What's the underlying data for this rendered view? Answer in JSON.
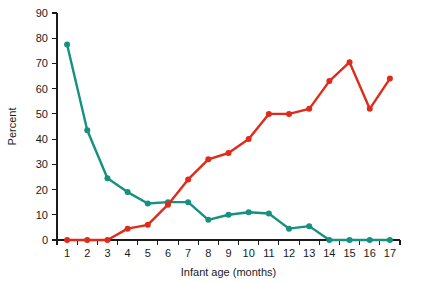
{
  "chart_data": {
    "type": "line",
    "title": "",
    "xlabel": "Infant age (months)",
    "ylabel": "Percent",
    "x": [
      1,
      2,
      3,
      4,
      5,
      6,
      7,
      8,
      9,
      10,
      11,
      12,
      13,
      14,
      15,
      16,
      17
    ],
    "xtick_labels": [
      "1",
      "2",
      "3",
      "4",
      "5",
      "6",
      "7",
      "8",
      "9",
      "10",
      "11",
      "12",
      "13",
      "14",
      "15",
      "16",
      "17"
    ],
    "ytick_labels": [
      "0",
      "10",
      "20",
      "30",
      "40",
      "50",
      "60",
      "70",
      "80",
      "90"
    ],
    "yticks": [
      0,
      10,
      20,
      30,
      40,
      50,
      60,
      70,
      80,
      90
    ],
    "xlim": [
      0.5,
      17.5
    ],
    "ylim": [
      0,
      90
    ],
    "grid": false,
    "legend": "none",
    "series": [
      {
        "name": "teal-series",
        "color": "#16907f",
        "marker": "circle",
        "values": [
          77.5,
          43.5,
          24.5,
          19.0,
          14.5,
          15.0,
          15.0,
          8.0,
          10.0,
          11.0,
          10.5,
          4.5,
          5.5,
          0.0,
          0.0,
          0.0,
          0.0
        ]
      },
      {
        "name": "red-series",
        "color": "#e02b1b",
        "marker": "circle",
        "values": [
          0.0,
          0.0,
          0.0,
          4.5,
          6.0,
          14.0,
          24.0,
          32.0,
          34.5,
          40.0,
          50.0,
          50.0,
          52.0,
          63.0,
          70.5,
          52.0,
          64.0
        ]
      }
    ]
  }
}
